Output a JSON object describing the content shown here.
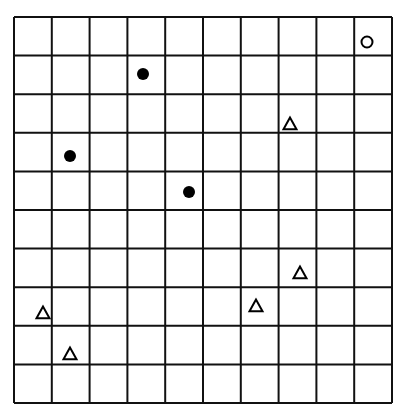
{
  "grid": {
    "rows": 10,
    "cols": 10,
    "origin": [
      14,
      17
    ],
    "cell_width": 37.8,
    "cell_height": 38.6,
    "line_color": "#111111",
    "line_width": 2
  },
  "markers": [
    {
      "type": "circle",
      "x": 367,
      "y": 42,
      "row": 0,
      "col": 9
    },
    {
      "type": "dot",
      "x": 143,
      "y": 74,
      "row": 1,
      "col": 3
    },
    {
      "type": "triangle",
      "x": 290,
      "y": 124,
      "row": 3,
      "col": 7
    },
    {
      "type": "dot",
      "x": 70,
      "y": 156,
      "row": 3,
      "col": 1
    },
    {
      "type": "dot",
      "x": 189,
      "y": 192,
      "row": 4,
      "col": 4
    },
    {
      "type": "triangle",
      "x": 300,
      "y": 273,
      "row": 6,
      "col": 7
    },
    {
      "type": "triangle",
      "x": 256,
      "y": 306,
      "row": 7,
      "col": 6
    },
    {
      "type": "triangle",
      "x": 43,
      "y": 313,
      "row": 7,
      "col": 0
    },
    {
      "type": "triangle",
      "x": 70,
      "y": 354,
      "row": 8,
      "col": 1
    }
  ]
}
